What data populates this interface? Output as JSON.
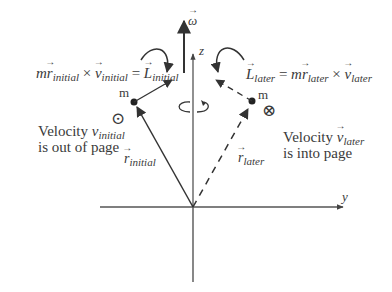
{
  "diagram": {
    "axes": {
      "omega_label": "ω",
      "z_label": "z",
      "y_label": "y"
    },
    "initial": {
      "equation": {
        "m": "m",
        "r": "r",
        "r_sub": "initial",
        "cross": "×",
        "v": "v",
        "v_sub": "initial",
        "equals": "=",
        "L": "L",
        "L_sub": "initial"
      },
      "mass_label": "m",
      "velocity_symbol": "⊙",
      "velocity_text_line1_prefix": "Velocity ",
      "velocity_text_v": "v",
      "velocity_text_v_sub": "initial",
      "velocity_text_line2": "is out of page",
      "position_label": "r",
      "position_label_sub": "initial"
    },
    "later": {
      "equation": {
        "L": "L",
        "L_sub": "later",
        "equals": "=",
        "m": "m",
        "r": "r",
        "r_sub": "later",
        "cross": "×",
        "v": "v",
        "v_sub": "later"
      },
      "mass_label": "m",
      "velocity_symbol": "⊗",
      "velocity_text_line1_prefix": "Velocity ",
      "velocity_text_v": "v",
      "velocity_text_v_sub": "later",
      "velocity_text_line2": "is into page",
      "position_label": "r",
      "position_label_sub": "later"
    },
    "colors": {
      "line": "#444444",
      "text": "#3a3a3a"
    }
  }
}
